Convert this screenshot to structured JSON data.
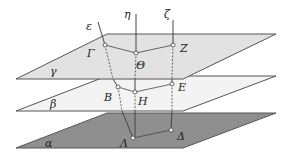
{
  "diagram": {
    "type": "parallel-planes-proportional-segments",
    "colors": {
      "plane_gamma": "#e2e2e2",
      "plane_beta": "#f3f3f3",
      "plane_alpha": "#8f8f8f",
      "edge": "#555555",
      "line": "#444444"
    },
    "planes": [
      {
        "id": "gamma",
        "label": "γ",
        "fill": "#e2e2e2",
        "points": "16,79 107,34 276,34 183,79",
        "label_x": 50,
        "label_y": 75
      },
      {
        "id": "beta",
        "label": "β",
        "fill": "#f3f3f3",
        "points": "16,111 107,76 276,76 183,111",
        "label_x": 50,
        "label_y": 108
      },
      {
        "id": "alpha",
        "label": "α",
        "fill": "#8f8f8f",
        "points": "16,148 107,113 276,113 183,148",
        "label_x": 45,
        "label_y": 147
      }
    ],
    "lines": [
      {
        "id": "epsilon",
        "label": "ε",
        "label_x": 86,
        "label_y": 30
      },
      {
        "id": "eta",
        "label": "η",
        "label_x": 124,
        "label_y": 18
      },
      {
        "id": "zeta",
        "label": "ζ",
        "label_x": 164,
        "label_y": 18
      }
    ],
    "points": [
      {
        "name": "Γ",
        "x": 105,
        "y": 45,
        "label_x": 87,
        "label_y": 57
      },
      {
        "name": "Θ",
        "x": 136,
        "y": 53,
        "label_x": 136,
        "label_y": 69
      },
      {
        "name": "Z",
        "x": 173,
        "y": 45,
        "label_x": 180,
        "label_y": 52
      },
      {
        "name": "B",
        "x": 118,
        "y": 87,
        "label_x": 104,
        "label_y": 101
      },
      {
        "name": "H",
        "x": 135,
        "y": 92,
        "label_x": 138,
        "label_y": 105
      },
      {
        "name": "E",
        "x": 172,
        "y": 84,
        "label_x": 178,
        "label_y": 91
      },
      {
        "name": "Λ",
        "x": 133,
        "y": 138,
        "label_x": 120,
        "label_y": 147
      },
      {
        "name": "Δ",
        "x": 171,
        "y": 130,
        "label_x": 177,
        "label_y": 140
      }
    ]
  }
}
